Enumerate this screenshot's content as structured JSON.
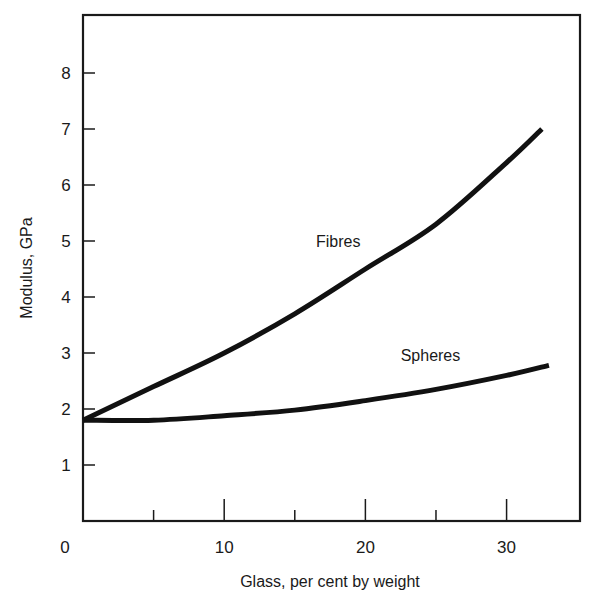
{
  "chart_data": {
    "type": "line",
    "title": "",
    "xlabel": "Glass, per cent by weight",
    "ylabel": "Modulus, GPa",
    "xlim": [
      0,
      35.2
    ],
    "ylim": [
      0,
      8.8
    ],
    "x_ticks_major": [
      0,
      10,
      20,
      30
    ],
    "x_ticks_minor": [
      5,
      15,
      25
    ],
    "y_ticks": [
      1,
      2,
      3,
      4,
      5,
      6,
      7,
      8
    ],
    "x_tick_labels": [
      "0",
      "10",
      "20",
      "30"
    ],
    "y_tick_labels": [
      "1",
      "2",
      "3",
      "4",
      "5",
      "6",
      "7",
      "8"
    ],
    "grid": false,
    "legend": "inline labels",
    "series": [
      {
        "name": "Fibres",
        "x": [
          0,
          5,
          10,
          15,
          20,
          25,
          30,
          32.5
        ],
        "values": [
          1.8,
          2.4,
          3.0,
          3.7,
          4.5,
          5.3,
          6.4,
          7.0
        ]
      },
      {
        "name": "Spheres",
        "x": [
          0,
          5,
          10,
          15,
          20,
          25,
          30,
          33
        ],
        "values": [
          1.8,
          1.8,
          1.88,
          1.98,
          2.15,
          2.35,
          2.6,
          2.78
        ]
      }
    ],
    "annotations": [
      {
        "text": "Fibres",
        "x": 16.5,
        "y": 4.9
      },
      {
        "text": "Spheres",
        "x": 22.5,
        "y": 2.85
      }
    ]
  },
  "colors": {
    "line": "#111111",
    "axis": "#1a1a1a",
    "background": "#ffffff"
  }
}
